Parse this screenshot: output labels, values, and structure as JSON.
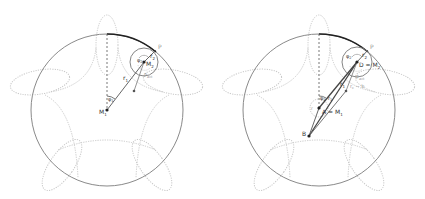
{
  "colors": {
    "main_circle": "#8a8a8a",
    "path_arc": "#222222",
    "dotted_curve": "#c8c8c8",
    "line": "#555555",
    "label": "#333333",
    "label_light": "#9a9a9a"
  },
  "panels": [
    {
      "id": "left",
      "labels": {
        "P": "P",
        "r2": "r",
        "r2_sub": "2",
        "phi2": "φ",
        "phi2_sub": "2",
        "M2": "M",
        "M2_sub": "2",
        "r1": "r",
        "r1_sub": "1",
        "P_act": "P",
        "P_act_sub": "act",
        "phi1": "φ",
        "phi1_sub": "1",
        "M1": "M",
        "M1_sub": "1"
      }
    },
    {
      "id": "right",
      "labels": {
        "P": "P",
        "r2": "r",
        "r2_sub": "2",
        "phi2": "φ",
        "phi2_sub": "2",
        "D_eq_M2": "D = M",
        "D_eq_M2_sub": "2",
        "P_act": "P",
        "P_act_sub": "act",
        "r1": "r",
        "r1_sub": "1",
        "rc_minus_b": "r",
        "rc_minus_b_sub": "c",
        "rc_minus_b_tail": " − b",
        "phi1": "φ",
        "phi1_sub": "1",
        "A_eq_M1": "A = M",
        "A_eq_M1_sub": "1",
        "r_small": "r",
        "B": "B"
      }
    }
  ]
}
